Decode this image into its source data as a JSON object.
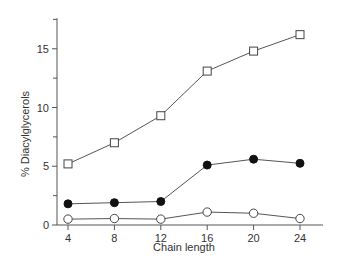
{
  "chart_data": {
    "type": "line",
    "title": "",
    "xlabel": "Chain length",
    "ylabel": "% Diacylglycerols",
    "x": [
      4,
      8,
      12,
      16,
      20,
      24
    ],
    "xticks": [
      4,
      8,
      12,
      16,
      20,
      24
    ],
    "yticks_major": [
      0,
      5,
      10,
      15
    ],
    "yticks_minor": [
      2.5,
      7.5,
      12.5,
      17.5
    ],
    "ylim": [
      0,
      17.6
    ],
    "xlim": [
      2.5,
      26
    ],
    "grid": false,
    "legend": null,
    "series": [
      {
        "name": "open squares",
        "marker": "square-open",
        "values": [
          5.2,
          7.0,
          9.3,
          13.1,
          14.8,
          16.2
        ]
      },
      {
        "name": "filled circles",
        "marker": "circle-filled",
        "values": [
          1.8,
          1.9,
          2.0,
          5.1,
          5.6,
          5.25
        ]
      },
      {
        "name": "open circles",
        "marker": "circle-open",
        "values": [
          0.5,
          0.55,
          0.5,
          1.1,
          1.0,
          0.55
        ]
      }
    ]
  },
  "colors": {
    "axis": "#555555",
    "line": "#555555",
    "marker_fill_filled": "#111111",
    "marker_fill_open": "#ffffff",
    "text": "#333333"
  }
}
